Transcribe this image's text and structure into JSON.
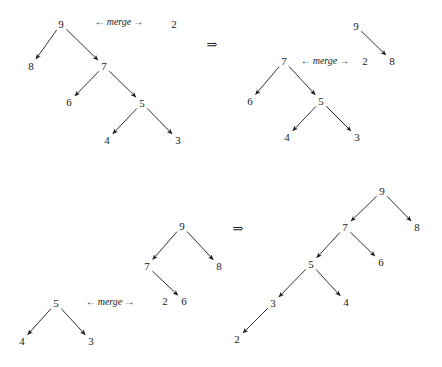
{
  "figure": {
    "background_color": "#ffffff",
    "text_color": "#222222",
    "width": 442,
    "height": 367,
    "implies_symbol": "⇒",
    "merge_left_arrow": "←",
    "merge_right_arrow": "→",
    "merge_word": "merge"
  },
  "panels": [
    {
      "id": "top-row",
      "implies": {
        "symbol": "⇒",
        "x": 212,
        "y": 44
      },
      "merge_labels": [
        {
          "id": "merge-top-left",
          "text": "← merge →",
          "x": 119,
          "y": 22
        },
        {
          "id": "merge-top-right",
          "text": "← merge →",
          "x": 325,
          "y": 61
        }
      ],
      "trees": [
        {
          "id": "tree-top-left",
          "nodes": [
            {
              "id": "tl-9",
              "label": "9",
              "x": 61,
              "y": 24
            },
            {
              "id": "tl-8",
              "label": "8",
              "x": 31,
              "y": 66
            },
            {
              "id": "tl-7",
              "label": "7",
              "x": 104,
              "y": 66
            },
            {
              "id": "tl-6",
              "label": "6",
              "x": 69,
              "y": 102
            },
            {
              "id": "tl-5",
              "label": "5",
              "x": 142,
              "y": 103
            },
            {
              "id": "tl-4",
              "label": "4",
              "x": 107,
              "y": 140
            },
            {
              "id": "tl-3",
              "label": "3",
              "x": 178,
              "y": 140
            }
          ],
          "edges": [
            {
              "from": "tl-9",
              "to": "tl-8"
            },
            {
              "from": "tl-9",
              "to": "tl-7"
            },
            {
              "from": "tl-7",
              "to": "tl-6"
            },
            {
              "from": "tl-7",
              "to": "tl-5"
            },
            {
              "from": "tl-5",
              "to": "tl-4"
            },
            {
              "from": "tl-5",
              "to": "tl-3"
            }
          ]
        },
        {
          "id": "tree-top-left-operand",
          "nodes": [
            {
              "id": "tl-op-2",
              "label": "2",
              "x": 174,
              "y": 24
            }
          ],
          "edges": []
        },
        {
          "id": "tree-top-right",
          "nodes": [
            {
              "id": "tr-9",
              "label": "9",
              "x": 356,
              "y": 26
            },
            {
              "id": "tr-8",
              "label": "8",
              "x": 392,
              "y": 61
            },
            {
              "id": "tr-7",
              "label": "7",
              "x": 284,
              "y": 61
            },
            {
              "id": "tr-6",
              "label": "6",
              "x": 250,
              "y": 101
            },
            {
              "id": "tr-5",
              "label": "5",
              "x": 321,
              "y": 101
            },
            {
              "id": "tr-4",
              "label": "4",
              "x": 287,
              "y": 137
            },
            {
              "id": "tr-3",
              "label": "3",
              "x": 357,
              "y": 137
            },
            {
              "id": "tr-op-2",
              "label": "2",
              "x": 365,
              "y": 61
            }
          ],
          "edges": [
            {
              "from": "tr-9",
              "to": "tr-8"
            },
            {
              "from": "tr-7",
              "to": "tr-6"
            },
            {
              "from": "tr-7",
              "to": "tr-5"
            },
            {
              "from": "tr-5",
              "to": "tr-4"
            },
            {
              "from": "tr-5",
              "to": "tr-3"
            }
          ]
        }
      ]
    },
    {
      "id": "bottom-row",
      "implies": {
        "symbol": "⇒",
        "x": 238,
        "y": 228
      },
      "merge_labels": [
        {
          "id": "merge-bottom-left",
          "text": "← merge →",
          "x": 110,
          "y": 302
        }
      ],
      "trees": [
        {
          "id": "tree-bottom-left",
          "nodes": [
            {
              "id": "bl-5",
              "label": "5",
              "x": 56,
              "y": 303
            },
            {
              "id": "bl-4",
              "label": "4",
              "x": 22,
              "y": 341
            },
            {
              "id": "bl-3",
              "label": "3",
              "x": 91,
              "y": 341
            }
          ],
          "edges": [
            {
              "from": "bl-5",
              "to": "bl-4"
            },
            {
              "from": "bl-5",
              "to": "bl-3"
            }
          ]
        },
        {
          "id": "tree-bottom-middle",
          "nodes": [
            {
              "id": "bm-9",
              "label": "9",
              "x": 182,
              "y": 226
            },
            {
              "id": "bm-7",
              "label": "7",
              "x": 147,
              "y": 266
            },
            {
              "id": "bm-8",
              "label": "8",
              "x": 219,
              "y": 266
            },
            {
              "id": "bm-2",
              "label": "2",
              "x": 165,
              "y": 301
            },
            {
              "id": "bm-6",
              "label": "6",
              "x": 184,
              "y": 301
            }
          ],
          "edges": [
            {
              "from": "bm-9",
              "to": "bm-7"
            },
            {
              "from": "bm-9",
              "to": "bm-8"
            },
            {
              "from": "bm-7",
              "to": "bm-6"
            }
          ]
        },
        {
          "id": "tree-bottom-right",
          "nodes": [
            {
              "id": "br-9",
              "label": "9",
              "x": 382,
              "y": 191
            },
            {
              "id": "br-7",
              "label": "7",
              "x": 345,
              "y": 227
            },
            {
              "id": "br-8",
              "label": "8",
              "x": 417,
              "y": 227
            },
            {
              "id": "br-5",
              "label": "5",
              "x": 311,
              "y": 264
            },
            {
              "id": "br-6",
              "label": "6",
              "x": 381,
              "y": 262
            },
            {
              "id": "br-3",
              "label": "3",
              "x": 273,
              "y": 303
            },
            {
              "id": "br-4",
              "label": "4",
              "x": 346,
              "y": 302
            },
            {
              "id": "br-2",
              "label": "2",
              "x": 237,
              "y": 339
            }
          ],
          "edges": [
            {
              "from": "br-9",
              "to": "br-7"
            },
            {
              "from": "br-9",
              "to": "br-8"
            },
            {
              "from": "br-7",
              "to": "br-5"
            },
            {
              "from": "br-7",
              "to": "br-6"
            },
            {
              "from": "br-5",
              "to": "br-3"
            },
            {
              "from": "br-5",
              "to": "br-4"
            },
            {
              "from": "br-3",
              "to": "br-2"
            }
          ]
        }
      ]
    }
  ]
}
